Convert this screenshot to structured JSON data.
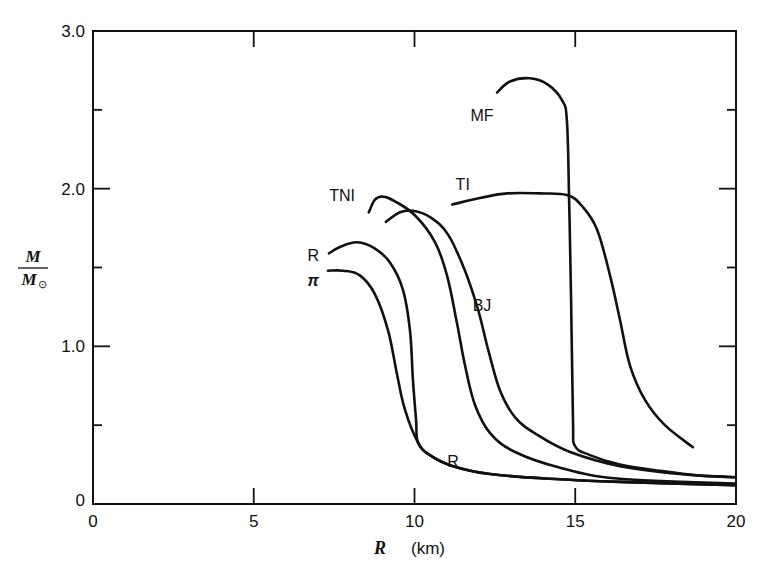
{
  "chart_data": {
    "type": "line",
    "title": "",
    "xlabel": "R (km)",
    "ylabel": "M / M☉",
    "xlim": [
      0,
      20
    ],
    "ylim": [
      0,
      3.0
    ],
    "x_ticks": [
      0,
      5,
      10,
      15,
      20
    ],
    "x_tick_labels": [
      "0",
      "5",
      "10",
      "15",
      "20"
    ],
    "y_ticks": [
      0,
      1.0,
      2.0,
      3.0
    ],
    "y_tick_labels": [
      "0",
      "1.0",
      "2.0",
      "3.0"
    ],
    "y_minor_ticks": [
      0.5,
      1.5,
      2.5
    ],
    "grid": false,
    "legend": "inline curve labels",
    "series": [
      {
        "name": "MF",
        "label_pos": [
          12.1,
          2.47
        ],
        "points": [
          [
            12.57,
            2.61
          ],
          [
            12.97,
            2.68
          ],
          [
            13.59,
            2.7
          ],
          [
            14.15,
            2.66
          ],
          [
            14.59,
            2.56
          ],
          [
            14.74,
            2.43
          ],
          [
            14.81,
            1.93
          ],
          [
            14.87,
            1.29
          ],
          [
            14.93,
            0.53
          ],
          [
            14.99,
            0.37
          ],
          [
            15.46,
            0.31
          ],
          [
            16.39,
            0.25
          ],
          [
            17.64,
            0.21
          ],
          [
            18.88,
            0.18
          ],
          [
            19.97,
            0.17
          ]
        ]
      },
      {
        "name": "TI",
        "label_pos": [
          11.5,
          2.03
        ],
        "points": [
          [
            11.17,
            1.9
          ],
          [
            12.04,
            1.94
          ],
          [
            12.88,
            1.97
          ],
          [
            13.9,
            1.97
          ],
          [
            14.74,
            1.96
          ],
          [
            15.21,
            1.89
          ],
          [
            15.68,
            1.74
          ],
          [
            16.08,
            1.45
          ],
          [
            16.39,
            1.17
          ],
          [
            16.7,
            0.88
          ],
          [
            17.17,
            0.66
          ],
          [
            17.79,
            0.5
          ],
          [
            18.66,
            0.36
          ]
        ]
      },
      {
        "name": "TNI",
        "label_pos": [
          7.75,
          1.96
        ],
        "points": [
          [
            8.58,
            1.85
          ],
          [
            8.77,
            1.93
          ],
          [
            9.02,
            1.95
          ],
          [
            9.39,
            1.92
          ],
          [
            10.02,
            1.83
          ],
          [
            10.64,
            1.66
          ],
          [
            11.01,
            1.45
          ],
          [
            11.32,
            1.15
          ],
          [
            11.57,
            0.88
          ],
          [
            11.88,
            0.63
          ],
          [
            12.35,
            0.45
          ],
          [
            13.13,
            0.33
          ],
          [
            14.53,
            0.23
          ],
          [
            16.39,
            0.16
          ],
          [
            19.97,
            0.13
          ]
        ]
      },
      {
        "name": "BJ",
        "label_pos": [
          12.1,
          1.26
        ],
        "points": [
          [
            9.11,
            1.79
          ],
          [
            9.55,
            1.85
          ],
          [
            9.95,
            1.86
          ],
          [
            10.48,
            1.82
          ],
          [
            11.04,
            1.71
          ],
          [
            11.57,
            1.48
          ],
          [
            11.98,
            1.23
          ],
          [
            12.29,
            0.98
          ],
          [
            12.66,
            0.72
          ],
          [
            13.13,
            0.55
          ],
          [
            13.81,
            0.44
          ],
          [
            14.84,
            0.33
          ],
          [
            16.39,
            0.24
          ],
          [
            18.26,
            0.19
          ],
          [
            19.97,
            0.17
          ]
        ]
      },
      {
        "name": "R",
        "label_pos": [
          6.85,
          1.58
        ],
        "label2_pos": [
          11.2,
          0.27
        ],
        "points": [
          [
            7.34,
            1.59
          ],
          [
            7.68,
            1.63
          ],
          [
            8.21,
            1.66
          ],
          [
            8.77,
            1.62
          ],
          [
            9.24,
            1.53
          ],
          [
            9.64,
            1.36
          ],
          [
            9.86,
            1.1
          ],
          [
            9.95,
            0.79
          ],
          [
            10.05,
            0.53
          ],
          [
            10.11,
            0.39
          ],
          [
            10.48,
            0.31
          ],
          [
            11.2,
            0.24
          ],
          [
            12.35,
            0.19
          ],
          [
            14.21,
            0.16
          ],
          [
            16.39,
            0.14
          ],
          [
            19.97,
            0.12
          ]
        ]
      },
      {
        "name": "π",
        "label_pos": [
          6.85,
          1.42
        ],
        "points": [
          [
            7.31,
            1.48
          ],
          [
            7.78,
            1.48
          ],
          [
            8.3,
            1.45
          ],
          [
            8.77,
            1.33
          ],
          [
            9.18,
            1.1
          ],
          [
            9.46,
            0.82
          ],
          [
            9.7,
            0.6
          ],
          [
            10.11,
            0.39
          ],
          [
            10.48,
            0.31
          ],
          [
            11.2,
            0.24
          ],
          [
            12.35,
            0.19
          ],
          [
            14.21,
            0.16
          ],
          [
            16.39,
            0.14
          ],
          [
            19.97,
            0.12
          ]
        ]
      }
    ]
  },
  "axes": {
    "x_title_var": "R",
    "x_title_unit": "(km)",
    "y_title_num": "M",
    "y_title_den": "M",
    "y_title_den_sub": "⊙"
  }
}
